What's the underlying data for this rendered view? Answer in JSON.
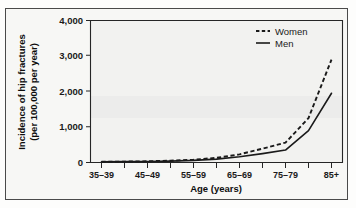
{
  "figure": {
    "background_color": "#f7f7f5",
    "frame_color": "#4a4a4a",
    "plot_background": "#f2f2f0",
    "ink_color": "#1a1a1a"
  },
  "axes": {
    "ylabel_line1": "Incidence of hip fractures",
    "ylabel_line2": "(per 100,000 per year)",
    "xlabel": "Age (years)",
    "yticks": [
      "0",
      "1,000",
      "2,000",
      "3,000",
      "4,000"
    ],
    "ytick_values": [
      0,
      1000,
      2000,
      3000,
      4000
    ],
    "xticklabels": [
      "35–39",
      "45–49",
      "55–59",
      "65–69",
      "75–79",
      "85+"
    ]
  },
  "legend": {
    "position": "top-right",
    "entries": [
      {
        "label": "Women",
        "style": "dashed"
      },
      {
        "label": "Men",
        "style": "solid"
      }
    ]
  },
  "chart_data": {
    "type": "line",
    "title": "",
    "subtitle": "",
    "xlabel": "Age (years)",
    "ylabel": "Incidence of hip fractures (per 100,000 per year)",
    "ylim": [
      0,
      4000
    ],
    "yticks": [
      0,
      1000,
      2000,
      3000,
      4000
    ],
    "grid": false,
    "legend_position": "top-right",
    "categories": [
      "35–39",
      "40–44",
      "45–49",
      "50–54",
      "55–59",
      "60–64",
      "65–69",
      "70–74",
      "75–79",
      "80–84",
      "85+"
    ],
    "series": [
      {
        "name": "Women",
        "style": "dashed",
        "values": [
          20,
          25,
          35,
          50,
          80,
          130,
          230,
          390,
          560,
          1250,
          2900
        ]
      },
      {
        "name": "Men",
        "style": "solid",
        "values": [
          20,
          25,
          30,
          40,
          60,
          95,
          160,
          250,
          350,
          900,
          1950
        ]
      }
    ],
    "annotations": []
  }
}
